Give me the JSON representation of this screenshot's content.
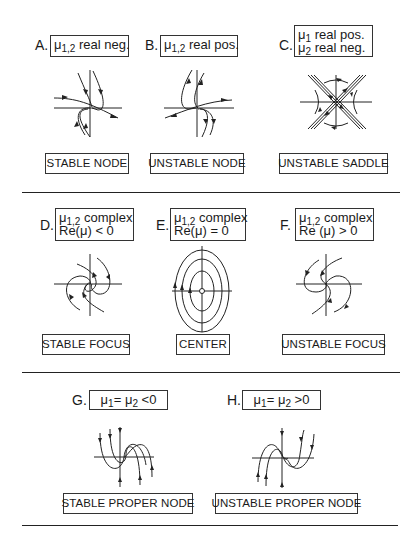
{
  "figure": {
    "panels": [
      {
        "id": "A",
        "letter": "A.",
        "condition": [
          "μ1,2 real neg."
        ],
        "caption": "STABLE NODE"
      },
      {
        "id": "B",
        "letter": "B.",
        "condition": [
          "μ1,2 real pos."
        ],
        "caption": "UNSTABLE NODE"
      },
      {
        "id": "C",
        "letter": "C.",
        "condition": [
          "μ1 real pos.",
          "μ2 real neg."
        ],
        "caption": "UNSTABLE SADDLE"
      },
      {
        "id": "D",
        "letter": "D.",
        "condition": [
          "μ1,2 complex",
          "Re(μ) < 0"
        ],
        "caption": "STABLE FOCUS"
      },
      {
        "id": "E",
        "letter": "E.",
        "condition": [
          "μ1,2 complex",
          "Re(μ) = 0"
        ],
        "caption": "CENTER"
      },
      {
        "id": "F",
        "letter": "F.",
        "condition": [
          "μ1,2 complex",
          "Re (μ) > 0"
        ],
        "caption": "UNSTABLE FOCUS"
      },
      {
        "id": "G",
        "letter": "G.",
        "condition": [
          "μ1= μ2 <0"
        ],
        "caption": "STABLE PROPER NODE"
      },
      {
        "id": "H",
        "letter": "H.",
        "condition": [
          "μ1= μ2 >0"
        ],
        "caption": "UNSTABLE PROPER NODE"
      }
    ],
    "cond_parts": {
      "A": {
        "mu": "μ",
        "sub": "1,2",
        "rest": " real neg."
      },
      "B": {
        "mu": "μ",
        "sub": "1,2",
        "rest": " real pos."
      },
      "C1": {
        "mu": "μ",
        "sub": "1",
        "rest": " real pos."
      },
      "C2": {
        "mu": "μ",
        "sub": "2",
        "rest": " real neg."
      },
      "D1": {
        "mu": "μ",
        "sub": "1,2",
        "rest": " complex"
      },
      "D2": "Re(μ) < 0",
      "E1": {
        "mu": "μ",
        "sub": "1,2",
        "rest": " complex"
      },
      "E2": "Re(μ) = 0",
      "F1": {
        "mu": "μ",
        "sub": "1,2",
        "rest": " complex"
      },
      "F2": "Re (μ) > 0",
      "G": {
        "mu1": "μ",
        "sub1": "1",
        "eq": "= ",
        "mu2": "μ",
        "sub2": "2",
        "rest": " <0"
      },
      "H": {
        "mu1": "μ",
        "sub1": "1",
        "eq": "= ",
        "mu2": "μ",
        "sub2": "2",
        "rest": " >0"
      }
    },
    "icons": {
      "A": "stable-node-phase-portrait",
      "B": "unstable-node-phase-portrait",
      "C": "saddle-phase-portrait",
      "D": "stable-focus-phase-portrait",
      "E": "center-phase-portrait",
      "F": "unstable-focus-phase-portrait",
      "G": "stable-proper-node-phase-portrait",
      "H": "unstable-proper-node-phase-portrait"
    }
  }
}
